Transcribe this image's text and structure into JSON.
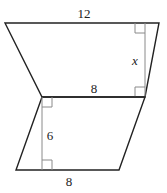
{
  "figure": {
    "trapezoid": {
      "top_base_label": "12",
      "bottom_base_label": "8",
      "height_label": "x"
    },
    "parallelogram": {
      "base_label": "8",
      "height_label": "6"
    },
    "colors": {
      "outline": "#222222",
      "height_line": "#8a8a8a"
    }
  }
}
